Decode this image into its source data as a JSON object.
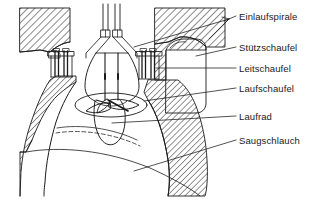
{
  "figure": {
    "kind": "technical-cross-section-drawing",
    "background_color": "#ffffff",
    "line_color": "#1a1a1a",
    "hatch_color": "#2b2b2b"
  },
  "labels": [
    {
      "id": "einlaufspirale",
      "text": "Einlaufspirale",
      "x": 239,
      "y": 11
    },
    {
      "id": "stuetzschaufel",
      "text": "Stützschaufel",
      "x": 239,
      "y": 42
    },
    {
      "id": "leitschaufel",
      "text": "Leitschaufel",
      "x": 239,
      "y": 63
    },
    {
      "id": "laufschaufel",
      "text": "Laufschaufel",
      "x": 239,
      "y": 83
    },
    {
      "id": "laufrad",
      "text": "Laufrad",
      "x": 239,
      "y": 111
    },
    {
      "id": "saugschlauch",
      "text": "Saugschlauch",
      "x": 239,
      "y": 135
    }
  ],
  "leaders": [
    {
      "id": "leader-einlaufspirale-left",
      "from_label": "einlaufspirale",
      "points": "232,16 130,47"
    },
    {
      "id": "leader-einlaufspirale-right",
      "from_label": "einlaufspirale",
      "points": "232,16 205,38"
    },
    {
      "id": "leader-einlaufspirale-arrow",
      "from_label": "einlaufspirale",
      "points": "232,16 224,22"
    },
    {
      "id": "leader-stuetzschaufel",
      "from_label": "stuetzschaufel",
      "points": "234,47 196,56"
    },
    {
      "id": "leader-leitschaufel",
      "from_label": "leitschaufel",
      "points": "234,68 157,68"
    },
    {
      "id": "leader-laufschaufel",
      "from_label": "laufschaufel",
      "points": "234,88 147,100"
    },
    {
      "id": "leader-laufrad",
      "from_label": "laufrad",
      "points": "234,116 113,123"
    },
    {
      "id": "leader-saugschlauch",
      "from_label": "saugschlauch",
      "points": "234,140 135,170"
    }
  ],
  "parts": [
    {
      "id": "concrete-left",
      "name": "concrete-block-left",
      "hatched": true
    },
    {
      "id": "concrete-right",
      "name": "concrete-block-right",
      "hatched": true
    },
    {
      "id": "concrete-lower-left",
      "name": "concrete-pier-lower-left",
      "hatched": true
    },
    {
      "id": "concrete-lower-right",
      "name": "concrete-pier-lower-right",
      "hatched": true
    },
    {
      "id": "spiral-casing-right",
      "name": "intake-spiral-casing-right",
      "hatched": false
    },
    {
      "id": "spiral-casing-left",
      "name": "intake-spiral-casing-left",
      "hatched": false
    },
    {
      "id": "turbine-shaft",
      "name": "turbine-shaft",
      "hatched": false
    },
    {
      "id": "runner",
      "name": "runner-propeller",
      "hatched": false
    },
    {
      "id": "draft-tube",
      "name": "draft-tube",
      "hatched": false
    },
    {
      "id": "stay-vanes-left",
      "name": "stay-vane-column-left",
      "hatched": false
    },
    {
      "id": "stay-vanes-right",
      "name": "stay-vane-column-right",
      "hatched": false
    }
  ]
}
